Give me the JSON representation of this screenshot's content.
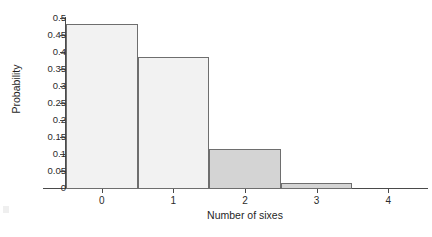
{
  "chart_data": {
    "type": "bar",
    "title": "",
    "subtitle": "",
    "xlabel": "Number of sixes",
    "ylabel": "Probability",
    "categories": [
      "0",
      "1",
      "2",
      "3",
      "4"
    ],
    "values": [
      0.482,
      0.386,
      0.116,
      0.016,
      0.0
    ],
    "series": [
      {
        "name": "Probability",
        "values": [
          0.482,
          0.386,
          0.116,
          0.016,
          0.0
        ]
      }
    ],
    "bar_fills": [
      "#f2f2f2",
      "#f2f2f2",
      "#d4d4d4",
      "#d4d4d4",
      "#ffffff"
    ],
    "bar_edge_color": "#6e6e6e",
    "ylim": [
      0,
      0.5
    ],
    "xlim": [
      -0.5,
      4.5
    ],
    "y_ticks": [
      0,
      0.05,
      0.1,
      0.15,
      0.2,
      0.25,
      0.3,
      0.35,
      0.4,
      0.45,
      0.5
    ],
    "y_tick_labels": [
      "0",
      "0.05",
      "0.1",
      "0.15",
      "0.2",
      "0.25",
      "0.3",
      "0.35",
      "0.4",
      "0.45",
      "0.5"
    ],
    "x_ticks": [
      0,
      1,
      2,
      3,
      4
    ],
    "x_tick_labels": [
      "0",
      "1",
      "2",
      "3",
      "4"
    ],
    "grid": false,
    "legend": false,
    "legend_position": "none",
    "annotations": []
  }
}
